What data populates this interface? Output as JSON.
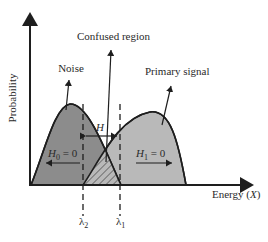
{
  "diagram": {
    "axes": {
      "ylabel": "Probability",
      "xlabel": "Energy (X)",
      "xlabel_prefix": "Energy (",
      "xlabel_var": "X",
      "xlabel_suffix": ")"
    },
    "annotations": {
      "noise": "Noise",
      "confused_region": "Confused region",
      "primary_signal": "Primary signal",
      "h_gap": "H",
      "h0": {
        "var": "H",
        "sub": "0",
        "rest": " = 0"
      },
      "h1": {
        "var": "H",
        "sub": "1",
        "rest": " = 0"
      },
      "lambda2": {
        "sym": "λ",
        "sub": "2"
      },
      "lambda1": {
        "sym": "λ",
        "sub": "1"
      }
    },
    "colors": {
      "noise_fill": "#8c8c8c",
      "signal_fill": "#b9b9b9",
      "stroke": "#1e1e1e",
      "background": "#ffffff"
    }
  }
}
